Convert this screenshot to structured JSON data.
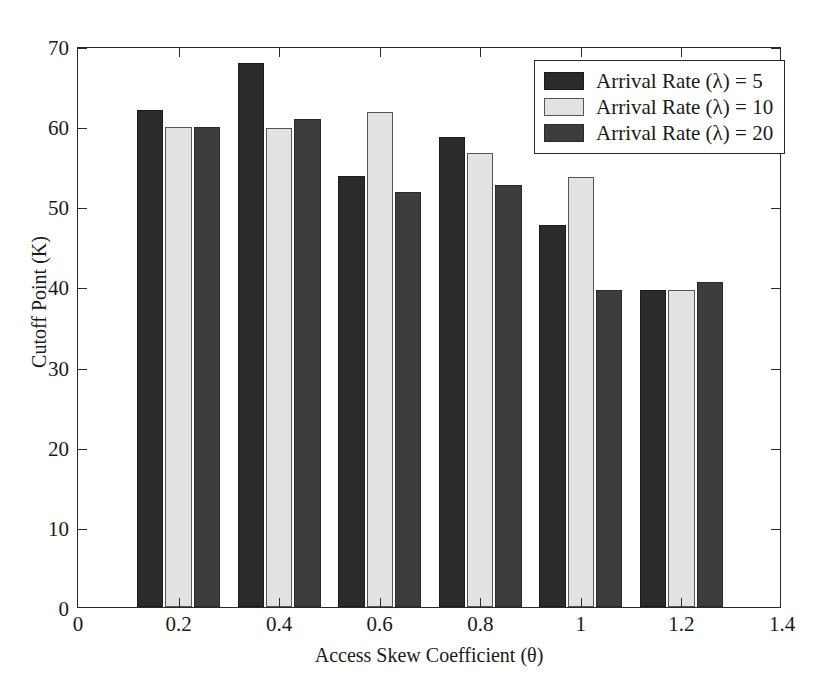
{
  "chart_data": {
    "type": "bar",
    "title": "",
    "subtitle": "",
    "xlabel": "Access Skew Coefficient (θ)",
    "ylabel": "Cutoff Point (K)",
    "categories": [
      "0.2",
      "0.4",
      "0.6",
      "0.8",
      "1",
      "1.2"
    ],
    "category_values": [
      0.2,
      0.4,
      0.6,
      0.8,
      1.0,
      1.2
    ],
    "series": [
      {
        "name": "Arrival Rate (λ) = 5",
        "color": "#2b2b2b",
        "values": [
          62.0,
          67.9,
          53.8,
          58.7,
          47.7,
          39.6
        ]
      },
      {
        "name": "Arrival Rate (λ) = 10",
        "color": "#e2e2e2",
        "values": [
          59.9,
          59.8,
          61.8,
          56.7,
          53.6,
          39.6
        ]
      },
      {
        "name": "Arrival Rate (λ) = 20",
        "color": "#3d3d3d",
        "values": [
          59.9,
          60.9,
          51.8,
          52.7,
          39.6,
          40.6
        ]
      }
    ],
    "xlim": [
      0,
      1.4
    ],
    "ylim": [
      0,
      70
    ],
    "xticks": [
      0,
      0.2,
      0.4,
      0.6,
      0.8,
      1.0,
      1.2,
      1.4
    ],
    "xticklabels": [
      "0",
      "0.2",
      "0.4",
      "0.6",
      "0.8",
      "1",
      "1.2",
      "1.4"
    ],
    "yticks": [
      0,
      10,
      20,
      30,
      40,
      50,
      60,
      70
    ],
    "yticklabels": [
      "0",
      "10",
      "20",
      "30",
      "40",
      "50",
      "60",
      "70"
    ],
    "grid": false,
    "legend_position": "top-right",
    "bar_group_width": 0.165,
    "bar_gap": 0.004
  }
}
